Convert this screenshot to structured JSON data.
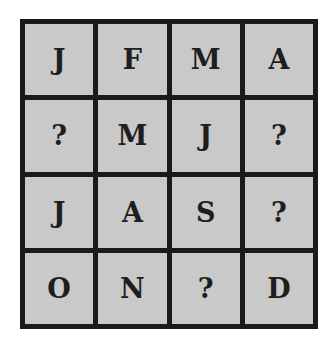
{
  "puzzle": {
    "description": "4x4 grid of month initials with missing letters",
    "colors": {
      "border": "#1a1a1a",
      "cell_fill": "#c9c9c9",
      "text": "#1e1e1e"
    },
    "rows": [
      [
        "J",
        "F",
        "M",
        "A"
      ],
      [
        "?",
        "M",
        "J",
        "?"
      ],
      [
        "J",
        "A",
        "S",
        "?"
      ],
      [
        "O",
        "N",
        "?",
        "D"
      ]
    ]
  }
}
